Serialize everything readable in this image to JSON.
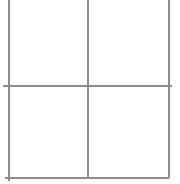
{
  "diagram": {
    "type": "grid",
    "rows": 2,
    "columns": 2,
    "line_color": "#8c8c8c",
    "background": "#ffffff",
    "vertical_lines": [
      {
        "x": 8,
        "y1": 0,
        "y2": 181
      },
      {
        "x": 87,
        "y1": 0,
        "y2": 178
      },
      {
        "x": 168,
        "y1": 0,
        "y2": 178
      }
    ],
    "horizontal_lines": [
      {
        "y": 85,
        "x1": 3,
        "x2": 172
      },
      {
        "y": 177,
        "x1": 5,
        "x2": 169
      }
    ],
    "cells": [
      {
        "row": 0,
        "col": 0,
        "text": ""
      },
      {
        "row": 0,
        "col": 1,
        "text": ""
      },
      {
        "row": 1,
        "col": 0,
        "text": ""
      },
      {
        "row": 1,
        "col": 1,
        "text": ""
      }
    ]
  }
}
